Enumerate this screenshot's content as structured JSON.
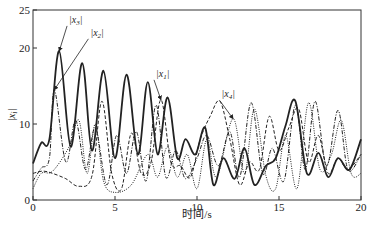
{
  "chart_data": {
    "type": "line",
    "title": "",
    "xlabel": "时间/s",
    "ylabel": "|x_i|",
    "xlim": [
      0,
      20
    ],
    "ylim": [
      0,
      25
    ],
    "xticks": [
      "0",
      "5",
      "10",
      "15",
      "20"
    ],
    "yticks": [
      "0",
      "10",
      "20",
      "25"
    ],
    "grid": false,
    "legend": "none (inline arrow annotations)",
    "annotations": [
      {
        "label": "|x3|",
        "text_at": [
          2.2,
          23.3
        ],
        "points_to": [
          1.6,
          19.6
        ]
      },
      {
        "label": "|x2|",
        "text_at": [
          3.5,
          21.6
        ],
        "points_to": [
          1.3,
          14.5
        ]
      },
      {
        "label": "|x1|",
        "text_at": [
          7.5,
          16.2
        ],
        "points_to": [
          7.8,
          13.2
        ]
      },
      {
        "label": "|x4|",
        "text_at": [
          11.5,
          13.5
        ],
        "points_to": [
          12.2,
          10.7
        ]
      }
    ],
    "series": [
      {
        "name": "|x3|",
        "style": "solid-thick",
        "x": [
          0,
          0.5,
          1.0,
          1.6,
          2.3,
          3.0,
          3.6,
          4.3,
          5.0,
          5.7,
          6.4,
          7.0,
          7.6,
          8.2,
          8.8,
          9.3,
          9.9,
          10.5,
          11.0,
          11.6,
          12.3,
          12.9,
          13.5,
          14.2,
          14.8,
          15.4,
          16.0,
          16.7,
          17.4,
          18.0,
          18.6,
          19.3,
          20.0
        ],
        "y": [
          4.8,
          7.5,
          8.0,
          19.6,
          7.0,
          18.0,
          6.5,
          17.0,
          5.5,
          16.5,
          6.0,
          15.5,
          6.0,
          13.5,
          5.5,
          8.0,
          6.0,
          9.5,
          2.0,
          5.5,
          2.8,
          6.8,
          2.0,
          4.5,
          5.5,
          9.8,
          13.0,
          3.5,
          6.2,
          3.0,
          5.5,
          4.0,
          8.0
        ]
      },
      {
        "name": "|x2|",
        "style": "dash-dot",
        "x": [
          0,
          0.5,
          1.0,
          1.3,
          2.0,
          2.6,
          3.2,
          3.8,
          4.5,
          5.1,
          5.7,
          6.3,
          6.9,
          7.5,
          8.1,
          8.7,
          9.3,
          10.0,
          10.6,
          11.3,
          12.0,
          12.6,
          13.3,
          14.0,
          14.6,
          15.3,
          16.0,
          16.6,
          17.2,
          17.9,
          18.6,
          19.2,
          20.0
        ],
        "y": [
          2.5,
          4.2,
          5.5,
          14.5,
          5.0,
          10.5,
          4.0,
          9.5,
          2.0,
          8.5,
          3.5,
          9.0,
          2.5,
          12.5,
          3.0,
          6.5,
          2.8,
          5.5,
          8.5,
          4.5,
          9.0,
          3.0,
          12.8,
          3.5,
          6.8,
          2.5,
          12.5,
          4.0,
          13.0,
          4.5,
          11.8,
          4.0,
          6.0
        ]
      },
      {
        "name": "|x1|",
        "style": "dashed",
        "x": [
          0,
          0.6,
          1.2,
          2.0,
          2.8,
          3.6,
          4.2,
          4.8,
          5.4,
          6.0,
          6.6,
          7.2,
          7.8,
          8.4,
          9.0,
          9.6,
          10.2,
          10.8,
          11.4,
          12.0,
          12.6,
          13.2,
          13.8,
          14.4,
          15.0,
          15.6,
          16.2,
          16.8,
          17.4,
          18.0,
          18.6,
          19.2,
          20.0
        ],
        "y": [
          3.5,
          3.8,
          3.5,
          2.8,
          1.8,
          3.2,
          13.0,
          3.5,
          1.5,
          8.8,
          3.5,
          5.0,
          13.2,
          5.0,
          4.5,
          3.0,
          8.0,
          11.0,
          13.0,
          8.0,
          2.0,
          5.0,
          4.0,
          11.0,
          6.5,
          9.5,
          12.0,
          5.0,
          8.5,
          3.5,
          5.5,
          4.0,
          6.0
        ]
      },
      {
        "name": "|x4|",
        "style": "dotted",
        "x": [
          0,
          0.5,
          1.2,
          2.2,
          2.8,
          3.3,
          3.8,
          4.3,
          5.0,
          6.0,
          7.0,
          7.6,
          8.2,
          8.8,
          9.4,
          10.0,
          10.6,
          11.2,
          12.2,
          12.9,
          13.5,
          14.2,
          14.8,
          15.4,
          16.1,
          16.8,
          17.5,
          18.2,
          18.8,
          19.4,
          20.0
        ],
        "y": [
          1.5,
          3.5,
          3.8,
          7.0,
          10.5,
          3.5,
          10.0,
          2.5,
          1.0,
          2.0,
          6.0,
          3.0,
          7.0,
          3.0,
          6.0,
          1.5,
          8.0,
          3.0,
          10.7,
          3.5,
          12.0,
          3.2,
          1.5,
          8.5,
          1.5,
          12.8,
          4.0,
          6.0,
          10.5,
          3.5,
          3.5
        ]
      }
    ]
  }
}
